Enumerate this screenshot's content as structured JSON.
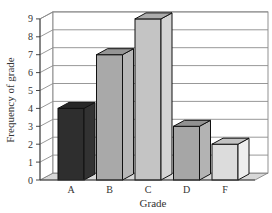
{
  "chart_data": {
    "type": "bar",
    "style": "3d-column",
    "title": "",
    "xlabel": "Grade",
    "ylabel": "Frequency of grade",
    "categories": [
      "A",
      "B",
      "C",
      "D",
      "F"
    ],
    "values": [
      4,
      7,
      9,
      3,
      2
    ],
    "ylim": [
      0,
      9
    ],
    "yticks": [
      "0",
      "1",
      "2",
      "3",
      "4",
      "5",
      "6",
      "7",
      "8",
      "9"
    ],
    "grid": true,
    "legend": "none",
    "colors": {
      "A": "#2e2e2e",
      "B": "#a9a9a9",
      "C": "#c4c4c4",
      "D": "#a6a6a6",
      "F": "#dcdcdc",
      "gridline": "#8c8c8c",
      "floor": "#d8d8d8"
    }
  }
}
